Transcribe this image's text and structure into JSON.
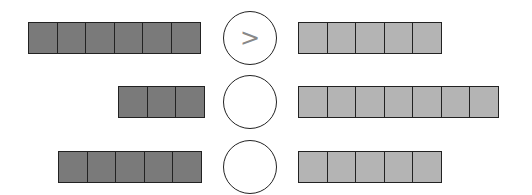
{
  "diagram": {
    "type": "number-comparison",
    "colors": {
      "left_fill": "#7a7a7a",
      "right_fill": "#b4b4b4",
      "border": "#222222"
    },
    "rows": [
      {
        "left_count": 6,
        "symbol": ">",
        "right_count": 5
      },
      {
        "left_count": 3,
        "symbol": "",
        "right_count": 7
      },
      {
        "left_count": 5,
        "symbol": "",
        "right_count": 5
      }
    ]
  }
}
